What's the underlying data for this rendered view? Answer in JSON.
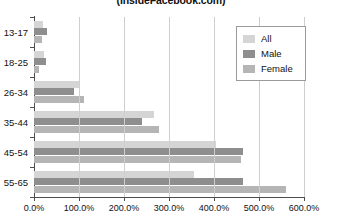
{
  "chart_data": {
    "type": "bar",
    "orientation": "horizontal",
    "title": "(InsideFacebook.com)",
    "xlabel": "",
    "ylabel": "",
    "xlim": [
      0,
      600
    ],
    "xticks": [
      0,
      100,
      200,
      300,
      400,
      500,
      600
    ],
    "xtick_labels": [
      "0.0%",
      "100.0%",
      "200.0%",
      "300.0%",
      "400.0%",
      "500.0%",
      "600.0%"
    ],
    "grid": true,
    "legend_position": "top-right",
    "categories": [
      "13-17",
      "18-25",
      "26-34",
      "35-44",
      "45-54",
      "55-65"
    ],
    "series": [
      {
        "name": "All",
        "color": "#d5d5d5",
        "values": [
          20,
          22,
          100,
          267,
          404,
          356
        ]
      },
      {
        "name": "Male",
        "color": "#8e8e8e",
        "values": [
          29,
          27,
          89,
          240,
          464,
          464
        ]
      },
      {
        "name": "Female",
        "color": "#b5b5b5",
        "values": [
          18,
          11,
          111,
          278,
          460,
          560
        ]
      }
    ]
  },
  "legend": {
    "items": [
      {
        "label": "All",
        "color": "#d5d5d5"
      },
      {
        "label": "Male",
        "color": "#8e8e8e"
      },
      {
        "label": "Female",
        "color": "#b5b5b5"
      }
    ]
  }
}
